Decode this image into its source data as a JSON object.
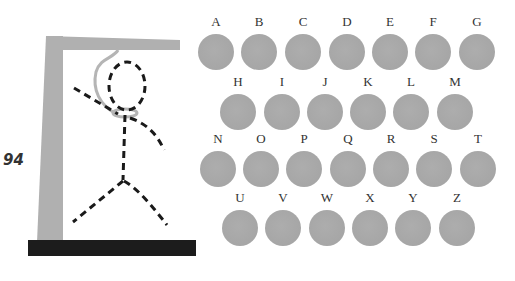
{
  "page": {
    "number": "94"
  },
  "colors": {
    "gallows": "#b0b0b0",
    "base": "#1c1c1c",
    "figure": "#1a1a1a",
    "rope": "#b5b5b5",
    "letter_disc": "#a8a8a8"
  },
  "game": {
    "title": "Hangman",
    "figure_parts": [
      "head",
      "body",
      "left-arm",
      "right-arm",
      "left-leg",
      "right-leg"
    ]
  },
  "keyboard": {
    "rows": [
      {
        "letters": [
          "A",
          "B",
          "C",
          "D",
          "E",
          "F",
          "G"
        ]
      },
      {
        "letters": [
          "H",
          "I",
          "J",
          "K",
          "L",
          "M"
        ]
      },
      {
        "letters": [
          "N",
          "O",
          "P",
          "Q",
          "R",
          "S",
          "T"
        ]
      },
      {
        "letters": [
          "U",
          "V",
          "W",
          "X",
          "Y",
          "Z"
        ]
      }
    ]
  }
}
